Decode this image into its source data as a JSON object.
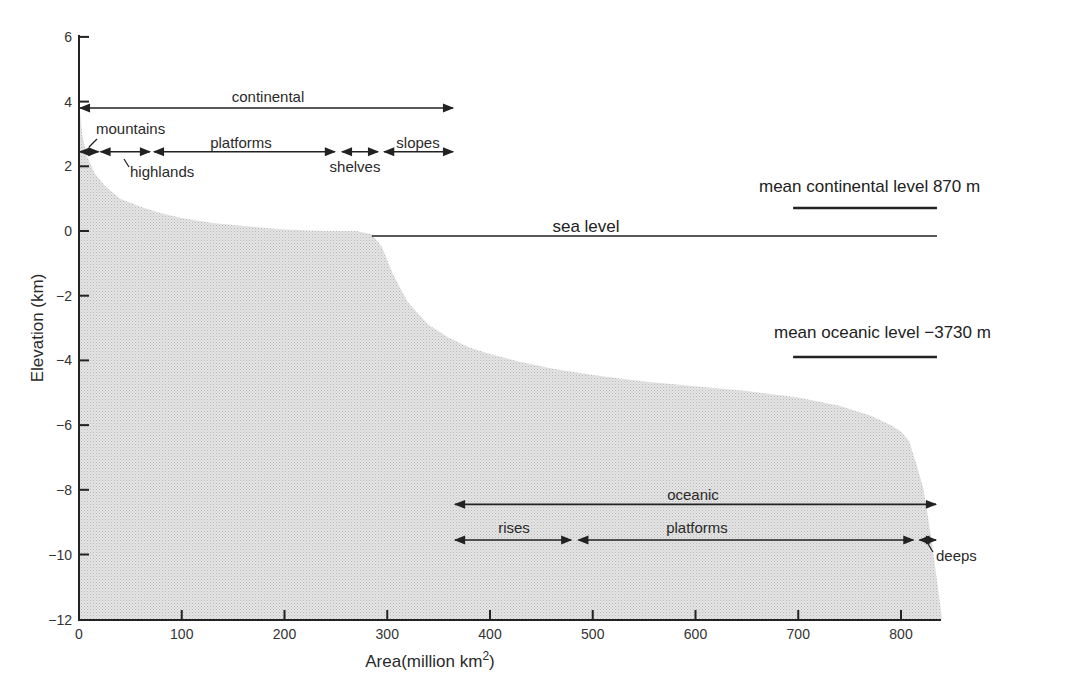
{
  "chart_data": {
    "type": "area",
    "title": "",
    "xlabel": "Area (million km²)",
    "xlabel_main": "Area",
    "xlabel_unit": "(million km",
    "xlabel_sup": "2",
    "xlabel_close": ")",
    "ylabel": "Elevation (km)",
    "xlim": [
      0,
      840
    ],
    "ylim": [
      -12,
      6
    ],
    "x_ticks": [
      0,
      100,
      200,
      300,
      400,
      500,
      600,
      700,
      800
    ],
    "y_ticks": [
      6,
      4,
      2,
      0,
      -2,
      -4,
      -6,
      -8,
      -10,
      -12
    ],
    "x_tick_labels": [
      "0",
      "100",
      "200",
      "300",
      "400",
      "500",
      "600",
      "700",
      "800"
    ],
    "y_tick_labels": [
      "6",
      "4",
      "2",
      "0",
      "−2",
      "−4",
      "−6",
      "−8",
      "−10",
      "−12"
    ],
    "grid": false,
    "fill_color": "#d9d9d9",
    "hypsometric_curve": {
      "x": [
        0,
        3,
        8,
        15,
        25,
        40,
        60,
        80,
        100,
        130,
        160,
        200,
        240,
        270,
        285,
        295,
        305,
        320,
        340,
        360,
        380,
        400,
        430,
        460,
        500,
        550,
        600,
        650,
        700,
        740,
        770,
        790,
        800,
        808,
        815,
        822,
        828,
        835,
        840
      ],
      "y": [
        4.0,
        3.0,
        2.3,
        1.8,
        1.4,
        1.0,
        0.75,
        0.55,
        0.4,
        0.25,
        0.15,
        0.05,
        0.0,
        0.0,
        -0.1,
        -0.5,
        -1.3,
        -2.2,
        -2.9,
        -3.3,
        -3.6,
        -3.8,
        -4.05,
        -4.25,
        -4.45,
        -4.65,
        -4.8,
        -4.95,
        -5.15,
        -5.4,
        -5.7,
        -6.0,
        -6.2,
        -6.5,
        -7.2,
        -8.0,
        -9.2,
        -10.8,
        -12.0
      ]
    },
    "reference_lines": [
      {
        "name": "sea level",
        "label": "sea level",
        "y": 0.0,
        "x_start": 285,
        "x_end": 835
      },
      {
        "name": "mean continental level",
        "label": "mean continental level 870 m",
        "y": 0.87,
        "x_start": 695,
        "x_end": 835
      },
      {
        "name": "mean oceanic level",
        "label": "mean oceanic level −3730 m",
        "y": -3.73,
        "x_start": 695,
        "x_end": 835
      }
    ],
    "annotations": [
      {
        "label": "continental",
        "x_start": 0,
        "x_end": 365,
        "y": 3.8
      },
      {
        "label": "mountains",
        "x_start": 0,
        "x_end": 20,
        "y": 2.45
      },
      {
        "label": "highlands",
        "x_start": 20,
        "x_end": 70,
        "y": 2.45
      },
      {
        "label": "platforms",
        "x_start": 72,
        "x_end": 250,
        "y": 2.45
      },
      {
        "label": "shelves",
        "x_start": 255,
        "x_end": 292,
        "y": 2.45
      },
      {
        "label": "slopes",
        "x_start": 296,
        "x_end": 365,
        "y": 2.45
      },
      {
        "label": "oceanic",
        "x_start": 365,
        "x_end": 835,
        "y": -8.45
      },
      {
        "label": "rises",
        "x_start": 365,
        "x_end": 480,
        "y": -9.55
      },
      {
        "label": "platforms",
        "x_start": 485,
        "x_end": 813,
        "y": -9.55
      },
      {
        "label": "deeps",
        "x_start": 817,
        "x_end": 835,
        "y": -9.55
      }
    ]
  },
  "labels": {
    "continental": "continental",
    "mountains": "mountains",
    "highlands": "highlands",
    "platforms_cont": "platforms",
    "shelves": "shelves",
    "slopes": "slopes",
    "sea_level": "sea level",
    "mean_continental": "mean continental level 870 m",
    "mean_oceanic": "mean oceanic level −3730 m",
    "oceanic": "oceanic",
    "rises": "rises",
    "platforms_ocean": "platforms",
    "deeps": "deeps"
  }
}
